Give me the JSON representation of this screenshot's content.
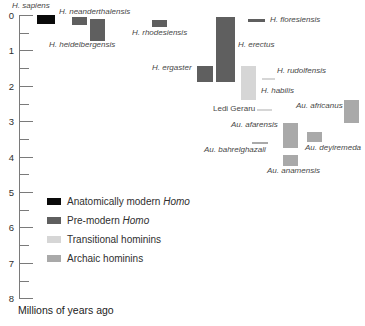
{
  "chart_data": {
    "type": "bar",
    "orientation": "vertical-time-ranges",
    "title": "",
    "ylabel": "Millions of years ago",
    "ylim": [
      0,
      8
    ],
    "y_tick_labels": [
      "0",
      "1",
      "2",
      "3",
      "4",
      "5",
      "6",
      "7",
      "8"
    ],
    "y_minor_step": 0.5,
    "grid": false,
    "legend_position": "lower-left",
    "groups": {
      "modern": {
        "label": "Anatomically modern Homo",
        "color": "#0a0a0a"
      },
      "premodern": {
        "label": "Pre-modern Homo",
        "color": "#5f5f5f"
      },
      "transitional": {
        "label": "Transitional hominins",
        "color": "#d6d6d6"
      },
      "archaic": {
        "label": "Archaic hominins",
        "color": "#a9a9a9"
      }
    },
    "species": [
      {
        "name": "H. sapiens",
        "group": "modern",
        "start_ma": 0.0,
        "end_ma": 0.25,
        "bar": {
          "x": 37,
          "w": 18
        },
        "label": {
          "x": 12,
          "y": 2,
          "italic": true
        }
      },
      {
        "name": "H. neanderthalensis",
        "group": "premodern",
        "start_ma": 0.06,
        "end_ma": 0.28,
        "bar": {
          "x": 72,
          "w": 15
        },
        "label": {
          "x": 59,
          "y": 8,
          "italic": true
        }
      },
      {
        "name": "H. heidelbergensis",
        "group": "premodern",
        "start_ma": 0.11,
        "end_ma": 0.73,
        "bar": {
          "x": 90,
          "w": 15
        },
        "label": {
          "x": 49,
          "y": 41,
          "italic": true
        }
      },
      {
        "name": "H. rhodesiensis",
        "group": "premodern",
        "start_ma": 0.14,
        "end_ma": 0.34,
        "bar": {
          "x": 152,
          "w": 15
        },
        "label": {
          "x": 132,
          "y": 29,
          "italic": true
        }
      },
      {
        "name": "H. floresiensis",
        "group": "premodern",
        "start_ma": 0.11,
        "end_ma": 0.2,
        "bar": {
          "x": 248,
          "w": 17
        },
        "label": {
          "x": 270,
          "y": 16,
          "italic": true
        }
      },
      {
        "name": "H. erectus",
        "group": "premodern",
        "start_ma": 0.06,
        "end_ma": 1.89,
        "bar": {
          "x": 216,
          "w": 19
        },
        "label": {
          "x": 238,
          "y": 41,
          "italic": true
        }
      },
      {
        "name": "H. ergaster",
        "group": "premodern",
        "start_ma": 1.44,
        "end_ma": 1.89,
        "bar": {
          "x": 197,
          "w": 16
        },
        "label": {
          "x": 152,
          "y": 64,
          "italic": true
        }
      },
      {
        "name": "H. habilis",
        "group": "transitional",
        "start_ma": 1.44,
        "end_ma": 2.4,
        "bar": {
          "x": 241,
          "w": 15
        },
        "label": {
          "x": 261,
          "y": 87,
          "italic": true
        }
      },
      {
        "name": "H. rudolfensis",
        "group": "transitional",
        "start_ma": 1.78,
        "end_ma": 1.84,
        "bar": {
          "x": 262,
          "w": 13
        },
        "label": {
          "x": 277,
          "y": 67,
          "italic": true
        }
      },
      {
        "name": "Ledi Geraru",
        "group": "transitional",
        "start_ma": 2.66,
        "end_ma": 2.71,
        "bar": {
          "x": 257,
          "w": 15
        },
        "label": {
          "x": 213,
          "y": 105,
          "italic": false
        }
      },
      {
        "name": "Au. africanus",
        "group": "archaic",
        "start_ma": 2.4,
        "end_ma": 3.05,
        "bar": {
          "x": 344,
          "w": 15
        },
        "label": {
          "x": 296,
          "y": 102,
          "italic": true
        }
      },
      {
        "name": "Au. afarensis",
        "group": "archaic",
        "start_ma": 3.05,
        "end_ma": 3.76,
        "bar": {
          "x": 283,
          "w": 15
        },
        "label": {
          "x": 231,
          "y": 121,
          "italic": true
        }
      },
      {
        "name": "Au. deyiremeda",
        "group": "archaic",
        "start_ma": 3.3,
        "end_ma": 3.59,
        "bar": {
          "x": 307,
          "w": 15
        },
        "label": {
          "x": 305,
          "y": 144,
          "italic": true
        }
      },
      {
        "name": "Au. bahrelghazali",
        "group": "archaic",
        "start_ma": 3.59,
        "end_ma": 3.64,
        "bar": {
          "x": 252,
          "w": 16
        },
        "label": {
          "x": 204,
          "y": 146,
          "italic": true
        }
      },
      {
        "name": "Au. anamensis",
        "group": "archaic",
        "start_ma": 3.95,
        "end_ma": 4.27,
        "bar": {
          "x": 283,
          "w": 15
        },
        "label": {
          "x": 267,
          "y": 167,
          "italic": true
        }
      }
    ]
  },
  "legend": {
    "items": [
      {
        "prefix": "Anatomically modern ",
        "italic": "Homo",
        "color": "#0a0a0a"
      },
      {
        "prefix": "Pre-modern ",
        "italic": "Homo",
        "color": "#5f5f5f"
      },
      {
        "prefix": "Transitional hominins",
        "italic": "",
        "color": "#d6d6d6"
      },
      {
        "prefix": "Archaic hominins",
        "italic": "",
        "color": "#a9a9a9"
      }
    ]
  },
  "footer": {
    "axis_caption": "Millions of years ago"
  }
}
